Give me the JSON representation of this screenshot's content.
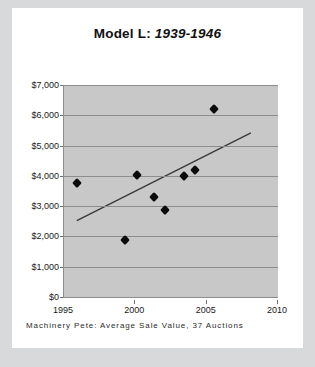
{
  "card": {
    "footer_note": "Machinery Pete: Average Sale Value, 37 Auctions"
  },
  "title": {
    "bold_part": "Model L:",
    "italic_part": "1939-1946",
    "full": "Model L: 1939-1946"
  },
  "colors": {
    "page_background": "#d7d9da",
    "card_background": "#ffffff",
    "plot_background": "#c8c8c8",
    "gridline": "#8d8d8d",
    "marker": "#0b0b0b",
    "trendline": "#3a3a3a"
  },
  "chart_data": {
    "type": "scatter",
    "title": "Model L: 1939-1946",
    "subtitle": "Machinery Pete: Average Sale Value, 37 Auctions",
    "xlabel": "",
    "ylabel": "",
    "xlim": [
      1995,
      2010
    ],
    "ylim": [
      0,
      7000
    ],
    "grid": true,
    "legend": "none",
    "xticks": [
      1995,
      2000,
      2005,
      2010
    ],
    "xtick_labels": [
      "1995",
      "2000",
      "2005",
      "2010"
    ],
    "yticks": [
      0,
      1000,
      2000,
      3000,
      4000,
      5000,
      6000,
      7000
    ],
    "ytick_labels": [
      "$0",
      "$1,000",
      "$2,000",
      "$3,000",
      "$4,000",
      "$5,000",
      "$6,000",
      "$7,000"
    ],
    "series": [
      {
        "name": "Average Sale Value",
        "marker": "diamond",
        "points": [
          {
            "x": 1995.9,
            "y": 3750
          },
          {
            "x": 1999.3,
            "y": 1880
          },
          {
            "x": 2000.1,
            "y": 4020
          },
          {
            "x": 2001.3,
            "y": 3300
          },
          {
            "x": 2002.1,
            "y": 2880
          },
          {
            "x": 2003.4,
            "y": 4000
          },
          {
            "x": 2004.2,
            "y": 4200
          },
          {
            "x": 2005.5,
            "y": 6200
          }
        ]
      }
    ],
    "trendline": {
      "type": "linear",
      "x_start": 1995.9,
      "y_start": 2520,
      "x_end": 2008.1,
      "y_end": 5420
    }
  }
}
